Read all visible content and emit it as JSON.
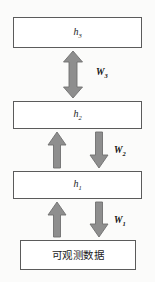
{
  "figure": {
    "name": "hierarchical-layer-diagram",
    "background_color": "#fbfbfa",
    "box_border_color": "#5b5b5b",
    "arrow_color": "#8e8e8e",
    "arrow_stroke_color": "#6f6f6f",
    "text_color": "#1c1c1c"
  },
  "layers": [
    {
      "id": "h3",
      "label_base": "h",
      "label_sub": "3",
      "role": "hidden-layer-3"
    },
    {
      "id": "h2",
      "label_base": "h",
      "label_sub": "2",
      "role": "hidden-layer-2"
    },
    {
      "id": "h1",
      "label_base": "h",
      "label_sub": "1",
      "role": "hidden-layer-1"
    },
    {
      "id": "data",
      "label": "可观测数据",
      "role": "observable-data-layer"
    }
  ],
  "weights": [
    {
      "id": "W3",
      "label_base": "W",
      "label_sub": "3",
      "between": "h3-h2",
      "arrow": "bidirectional"
    },
    {
      "id": "W2",
      "label_base": "W",
      "label_sub": "2",
      "between": "h2-h1",
      "arrow": "up-and-down"
    },
    {
      "id": "W1",
      "label_base": "W",
      "label_sub": "1",
      "between": "h1-data",
      "arrow": "up-and-down"
    }
  ],
  "arrows": {
    "bidirectional_h3_h2": "double-headed-vertical-arrow",
    "up_h1_to_h2": "up-arrow",
    "down_h2_to_h1": "down-arrow",
    "up_data_to_h1": "up-arrow",
    "down_h1_to_data": "down-arrow"
  }
}
